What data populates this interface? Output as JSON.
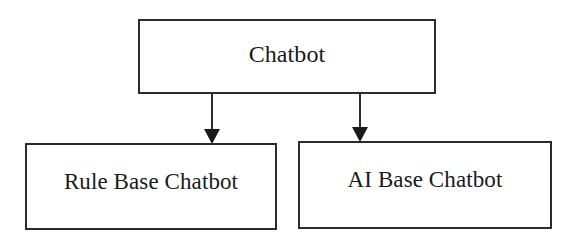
{
  "diagram": {
    "type": "tree",
    "root": {
      "id": "chatbot",
      "label": "Chatbot"
    },
    "children": [
      {
        "id": "rule-base-chatbot",
        "label": "Rule Base Chatbot"
      },
      {
        "id": "ai-base-chatbot",
        "label": "AI Base Chatbot"
      }
    ],
    "edges": [
      {
        "from": "chatbot",
        "to": "rule-base-chatbot",
        "style": "arrow"
      },
      {
        "from": "chatbot",
        "to": "ai-base-chatbot",
        "style": "arrow"
      }
    ],
    "colors": {
      "stroke": "#2b2b2b",
      "background": "#ffffff",
      "text": "#1a1a1a"
    }
  }
}
